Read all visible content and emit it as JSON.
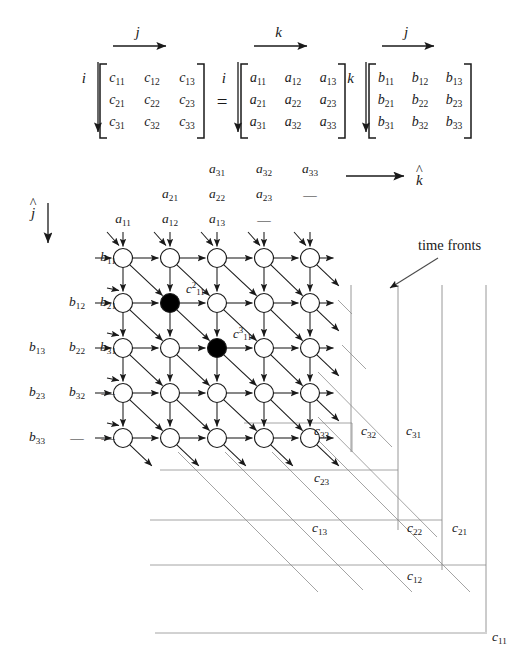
{
  "figure": {
    "equation": {
      "equals": "=",
      "matrices": [
        {
          "name": "C",
          "row_index_label": "i",
          "col_index_label": "j",
          "rows": [
            [
              "c11",
              "c12",
              "c13"
            ],
            [
              "c21",
              "c22",
              "c23"
            ],
            [
              "c31",
              "c32",
              "c33"
            ]
          ]
        },
        {
          "name": "A",
          "row_index_label": "i",
          "col_index_label": "k",
          "rows": [
            [
              "a11",
              "a12",
              "a13"
            ],
            [
              "a21",
              "a22",
              "a23"
            ],
            [
              "a31",
              "a32",
              "a33"
            ]
          ]
        },
        {
          "name": "B",
          "row_index_label": "k",
          "col_index_label": "j",
          "rows": [
            [
              "b11",
              "b12",
              "b13"
            ],
            [
              "b21",
              "b22",
              "b23"
            ],
            [
              "b31",
              "b32",
              "b33"
            ]
          ]
        }
      ]
    },
    "axes": {
      "horizontal": {
        "symbol": "k",
        "hat": true
      },
      "vertical": {
        "symbol": "j",
        "hat": true
      }
    },
    "annotation": {
      "time_fronts_label": "time fronts"
    },
    "top_inputs": {
      "description": "Staggered a-operands fed into the top of each array column",
      "rows": [
        [
          "",
          "",
          "a31",
          "a32",
          "a33"
        ],
        [
          "",
          "a21",
          "a22",
          "a23",
          "—"
        ],
        [
          "a11",
          "a12",
          "a13",
          "—",
          ""
        ]
      ]
    },
    "left_inputs": {
      "description": "Staggered b-operands fed into the left of each array row",
      "rows": [
        [
          "",
          "",
          "b11"
        ],
        [
          "",
          "b12",
          "b21"
        ],
        [
          "b13",
          "b22",
          "b31"
        ],
        [
          "b23",
          "b32",
          "—"
        ],
        [
          "b33",
          "—",
          "—"
        ]
      ]
    },
    "grid": {
      "columns": 5,
      "rows": 5,
      "highlighted_cells": [
        {
          "col": 2,
          "row": 2,
          "label_base": "c",
          "label_sub": "11",
          "label_sup": "2"
        },
        {
          "col": 3,
          "row": 3,
          "label_base": "c",
          "label_sub": "11",
          "label_sup": "3"
        }
      ]
    },
    "outputs": {
      "description": "Result values emitted along output wires",
      "labels": [
        "c33",
        "c32",
        "c31",
        "c23",
        "c13",
        "c22",
        "c21",
        "c12",
        "c11"
      ]
    },
    "symbols": {
      "c11": {
        "base": "c",
        "sub": "11"
      },
      "c12": {
        "base": "c",
        "sub": "12"
      },
      "c13": {
        "base": "c",
        "sub": "13"
      },
      "c21": {
        "base": "c",
        "sub": "21"
      },
      "c22": {
        "base": "c",
        "sub": "22"
      },
      "c23": {
        "base": "c",
        "sub": "23"
      },
      "c31": {
        "base": "c",
        "sub": "31"
      },
      "c32": {
        "base": "c",
        "sub": "32"
      },
      "c33": {
        "base": "c",
        "sub": "33"
      },
      "a11": {
        "base": "a",
        "sub": "11"
      },
      "a12": {
        "base": "a",
        "sub": "12"
      },
      "a13": {
        "base": "a",
        "sub": "13"
      },
      "a21": {
        "base": "a",
        "sub": "21"
      },
      "a22": {
        "base": "a",
        "sub": "22"
      },
      "a23": {
        "base": "a",
        "sub": "23"
      },
      "a31": {
        "base": "a",
        "sub": "31"
      },
      "a32": {
        "base": "a",
        "sub": "32"
      },
      "a33": {
        "base": "a",
        "sub": "33"
      },
      "b11": {
        "base": "b",
        "sub": "11"
      },
      "b12": {
        "base": "b",
        "sub": "12"
      },
      "b13": {
        "base": "b",
        "sub": "13"
      },
      "b21": {
        "base": "b",
        "sub": "21"
      },
      "b22": {
        "base": "b",
        "sub": "22"
      },
      "b23": {
        "base": "b",
        "sub": "23"
      },
      "b31": {
        "base": "b",
        "sub": "31"
      },
      "b32": {
        "base": "b",
        "sub": "32"
      },
      "b33": {
        "base": "b",
        "sub": "33"
      }
    },
    "colors": {
      "ink": "#1a1a1a",
      "node_fill": "#ffffff",
      "node_highlight": "#000000",
      "wire": "#8d8d8d"
    }
  }
}
